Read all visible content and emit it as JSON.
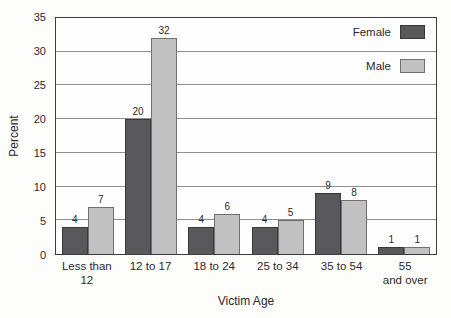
{
  "chart_data": {
    "type": "bar",
    "title": "",
    "xlabel": "Victim Age",
    "ylabel": "Percent",
    "categories": [
      "Less than\n12",
      "12 to 17",
      "18 to 24",
      "25 to 34",
      "35 to 54",
      "55\nand over"
    ],
    "series": [
      {
        "name": "Female",
        "color": "#59595b",
        "border_color": "#39393b",
        "values": [
          4,
          20,
          4,
          4,
          9,
          1
        ]
      },
      {
        "name": "Male",
        "color": "#c1c1c1",
        "border_color": "#707072",
        "values": [
          7,
          32,
          6,
          5,
          8,
          1
        ]
      }
    ],
    "ylim": [
      0,
      35
    ],
    "ytick_step": 5,
    "y_ticks": [
      0,
      5,
      10,
      15,
      20,
      25,
      30,
      35
    ],
    "grid": "horizontal",
    "legend_position": "top-right",
    "value_labels_shown": true
  },
  "colors": {
    "plot_border": "#3d3d3d",
    "gridline": "#8f8f8f",
    "text": "#2a2a2a",
    "background": "#fdfdfb"
  }
}
